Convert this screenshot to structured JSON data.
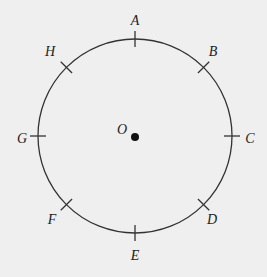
{
  "diagram": {
    "type": "circle-with-marked-points",
    "center": {
      "label": "O",
      "x": 135,
      "y": 136
    },
    "radius": 97,
    "stroke_color": "#333333",
    "background_color": "#efefef",
    "points": [
      {
        "label": "A",
        "angle_deg": 90,
        "label_x": 135,
        "label_y": 22
      },
      {
        "label": "B",
        "angle_deg": 45,
        "label_x": 213,
        "label_y": 53
      },
      {
        "label": "C",
        "angle_deg": 0,
        "label_x": 250,
        "label_y": 140
      },
      {
        "label": "D",
        "angle_deg": -45,
        "label_x": 212,
        "label_y": 221
      },
      {
        "label": "E",
        "angle_deg": -90,
        "label_x": 135,
        "label_y": 257
      },
      {
        "label": "F",
        "angle_deg": -135,
        "label_x": 52,
        "label_y": 221
      },
      {
        "label": "G",
        "angle_deg": 180,
        "label_x": 22,
        "label_y": 140
      },
      {
        "label": "H",
        "angle_deg": 135,
        "label_x": 50,
        "label_y": 53
      }
    ],
    "center_label_pos": {
      "x": 122,
      "y": 134
    }
  }
}
